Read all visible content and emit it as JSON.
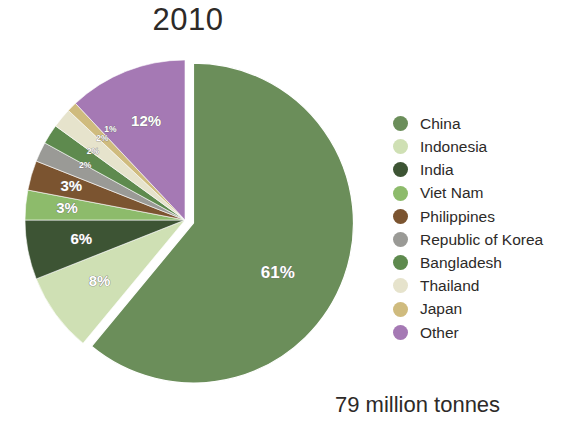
{
  "chart_data": {
    "type": "pie",
    "title": "2010",
    "caption": "79 million tonnes",
    "xlabel": "",
    "ylabel": "",
    "legend_position": "right",
    "grid": false,
    "total_label": "79 million tonnes",
    "exploded_slice": "China",
    "categories": [
      "China",
      "Indonesia",
      "India",
      "Viet Nam",
      "Philippines",
      "Republic of Korea",
      "Bangladesh",
      "Thailand",
      "Japan",
      "Other"
    ],
    "values": [
      61,
      8,
      6,
      3,
      3,
      2,
      2,
      2,
      1,
      12
    ],
    "value_labels": [
      "61%",
      "8%",
      "6%",
      "3%",
      "3%",
      "2%",
      "2%",
      "2%",
      "1%",
      "12%"
    ],
    "colors": [
      "#6b8e5a",
      "#cfe0b4",
      "#3d5434",
      "#8dbb6b",
      "#7b5430",
      "#9a9a96",
      "#5e8a4e",
      "#e6e3cc",
      "#cfbb7e",
      "#a579b4"
    ],
    "slices": [
      {
        "label": "China",
        "value": 61,
        "value_label": "61%",
        "color": "#6b8e5a"
      },
      {
        "label": "Indonesia",
        "value": 8,
        "value_label": "8%",
        "color": "#cfe0b4"
      },
      {
        "label": "India",
        "value": 6,
        "value_label": "6%",
        "color": "#3d5434"
      },
      {
        "label": "Viet Nam",
        "value": 3,
        "value_label": "3%",
        "color": "#8dbb6b"
      },
      {
        "label": "Philippines",
        "value": 3,
        "value_label": "3%",
        "color": "#7b5430"
      },
      {
        "label": "Republic of Korea",
        "value": 2,
        "value_label": "2%",
        "color": "#9a9a96"
      },
      {
        "label": "Bangladesh",
        "value": 2,
        "value_label": "2%",
        "color": "#5e8a4e"
      },
      {
        "label": "Thailand",
        "value": 2,
        "value_label": "2%",
        "color": "#e6e3cc"
      },
      {
        "label": "Japan",
        "value": 1,
        "value_label": "1%",
        "color": "#cfbb7e"
      },
      {
        "label": "Other",
        "value": 12,
        "value_label": "12%",
        "color": "#a579b4"
      }
    ]
  },
  "title": "2010",
  "caption": "79 million tonnes"
}
